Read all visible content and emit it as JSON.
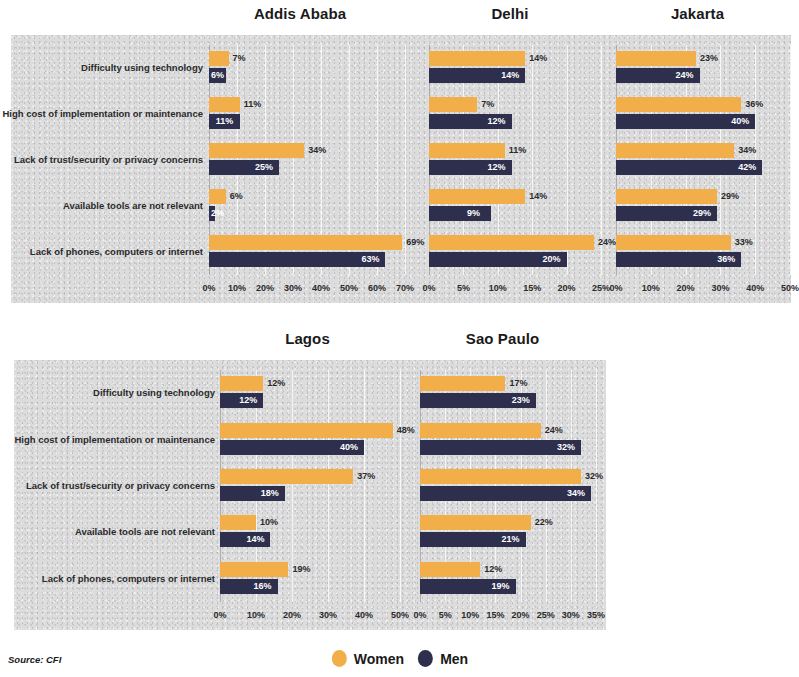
{
  "source_note": "Source: CFI",
  "legend": {
    "items": [
      {
        "label": "Women",
        "color": "#f2ae49"
      },
      {
        "label": "Men",
        "color": "#2e2f4d"
      }
    ]
  },
  "categories": [
    "Difficulty using technology",
    "High cost of implementation or maintenance",
    "Lack of trust/security or privacy concerns",
    "Available tools are not relevant",
    "Lack of phones, computers or internet"
  ],
  "chart_data": [
    {
      "type": "bar",
      "title": "Addis Ababa",
      "xlabel": "",
      "ylabel": "",
      "xlim": [
        0,
        70
      ],
      "xticks": [
        "0%",
        "10%",
        "20%",
        "30%",
        "40%",
        "50%",
        "60%",
        "70%"
      ],
      "tickvals": [
        0,
        10,
        20,
        30,
        40,
        50,
        60,
        70
      ],
      "grid": true,
      "legend_position": "bottom",
      "categories": [
        "Difficulty using technology",
        "High cost of implementation or maintenance",
        "Lack of trust/security or privacy concerns",
        "Available tools are not relevant",
        "Lack of phones, computers or internet"
      ],
      "series": [
        {
          "name": "Women",
          "color": "#f2ae49",
          "values": [
            7,
            11,
            34,
            6,
            69
          ],
          "labels": [
            "7%",
            "11%",
            "34%",
            "6%",
            "69%"
          ]
        },
        {
          "name": "Men",
          "color": "#2e2f4d",
          "values": [
            6,
            11,
            25,
            2,
            63
          ],
          "labels": [
            "6%",
            "11%",
            "25%",
            "2%",
            "63%"
          ]
        }
      ]
    },
    {
      "type": "bar",
      "title": "Delhi",
      "xlabel": "",
      "ylabel": "",
      "xlim": [
        0,
        25
      ],
      "xticks": [
        "0%",
        "5%",
        "10%",
        "15%",
        "20%",
        "25%"
      ],
      "tickvals": [
        0,
        5,
        10,
        15,
        20,
        25
      ],
      "grid": true,
      "legend_position": "bottom",
      "categories": [
        "Difficulty using technology",
        "High cost of implementation or maintenance",
        "Lack of trust/security or privacy concerns",
        "Available tools are not relevant",
        "Lack of phones, computers or internet"
      ],
      "series": [
        {
          "name": "Women",
          "color": "#f2ae49",
          "values": [
            14,
            7,
            11,
            14,
            24
          ],
          "labels": [
            "14%",
            "7%",
            "11%",
            "14%",
            "24%"
          ]
        },
        {
          "name": "Men",
          "color": "#2e2f4d",
          "values": [
            14,
            12,
            12,
            9,
            20
          ],
          "labels": [
            "14%",
            "12%",
            "12%",
            "9%",
            "20%"
          ]
        }
      ]
    },
    {
      "type": "bar",
      "title": "Jakarta",
      "xlabel": "",
      "ylabel": "",
      "xlim": [
        0,
        50
      ],
      "xticks": [
        "0%",
        "10%",
        "20%",
        "30%",
        "40%",
        "50%"
      ],
      "tickvals": [
        0,
        10,
        20,
        30,
        40,
        50
      ],
      "grid": true,
      "legend_position": "bottom",
      "categories": [
        "Difficulty using technology",
        "High cost of implementation or maintenance",
        "Lack of trust/security or privacy concerns",
        "Available tools are not relevant",
        "Lack of phones, computers or internet"
      ],
      "series": [
        {
          "name": "Women",
          "color": "#f2ae49",
          "values": [
            23,
            36,
            34,
            29,
            33
          ],
          "labels": [
            "23%",
            "36%",
            "34%",
            "29%",
            "33%"
          ]
        },
        {
          "name": "Men",
          "color": "#2e2f4d",
          "values": [
            24,
            40,
            42,
            29,
            36
          ],
          "labels": [
            "24%",
            "40%",
            "42%",
            "29%",
            "36%"
          ]
        }
      ]
    },
    {
      "type": "bar",
      "title": "Lagos",
      "xlabel": "",
      "ylabel": "",
      "xlim": [
        0,
        50
      ],
      "xticks": [
        "0%",
        "10%",
        "20%",
        "30%",
        "40%",
        "50%"
      ],
      "tickvals": [
        0,
        10,
        20,
        30,
        40,
        50
      ],
      "grid": true,
      "legend_position": "bottom",
      "categories": [
        "Difficulty using technology",
        "High cost of implementation or maintenance",
        "Lack of trust/security or privacy concerns",
        "Available tools are not relevant",
        "Lack of phones, computers or internet"
      ],
      "series": [
        {
          "name": "Women",
          "color": "#f2ae49",
          "values": [
            12,
            48,
            37,
            10,
            19
          ],
          "labels": [
            "12%",
            "48%",
            "37%",
            "10%",
            "19%"
          ]
        },
        {
          "name": "Men",
          "color": "#2e2f4d",
          "values": [
            12,
            40,
            18,
            14,
            16
          ],
          "labels": [
            "12%",
            "40%",
            "18%",
            "14%",
            "16%"
          ]
        }
      ]
    },
    {
      "type": "bar",
      "title": "Sao Paulo",
      "xlabel": "",
      "ylabel": "",
      "xlim": [
        0,
        35
      ],
      "xticks": [
        "0%",
        "5%",
        "10%",
        "15%",
        "20%",
        "25%",
        "30%",
        "35%"
      ],
      "tickvals": [
        0,
        5,
        10,
        15,
        20,
        25,
        30,
        35
      ],
      "grid": true,
      "legend_position": "bottom",
      "categories": [
        "Difficulty using technology",
        "High cost of implementation or maintenance",
        "Lack of trust/security or privacy concerns",
        "Available tools are not relevant",
        "Lack of phones, computers or internet"
      ],
      "series": [
        {
          "name": "Women",
          "color": "#f2ae49",
          "values": [
            17,
            24,
            32,
            22,
            12
          ],
          "labels": [
            "17%",
            "24%",
            "32%",
            "22%",
            "12%"
          ]
        },
        {
          "name": "Men",
          "color": "#2e2f4d",
          "values": [
            23,
            32,
            34,
            21,
            19
          ],
          "labels": [
            "23%",
            "32%",
            "34%",
            "21%",
            "19%"
          ]
        }
      ]
    }
  ]
}
